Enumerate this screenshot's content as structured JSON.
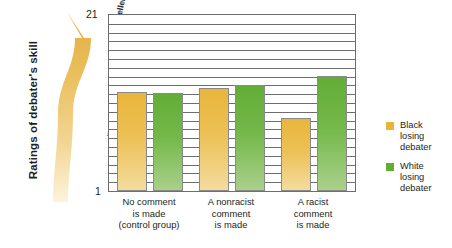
{
  "chart_data": {
    "type": "bar",
    "title": "",
    "ylabel": "Ratings of debater's skill",
    "xlabel": "",
    "ylim": [
      1,
      21
    ],
    "ytick_labels": [
      "1",
      "21"
    ],
    "y_low_anchor": "\"Very poor\"",
    "y_high_anchor": "\"Excellent\"",
    "grid": true,
    "gridline_count": 20,
    "legend_position": "right",
    "categories": [
      "No comment is made (control group)",
      "A nonracist comment is made",
      "A racist comment is made"
    ],
    "category_lines": [
      [
        "No comment",
        "is made",
        "(control group)"
      ],
      [
        "A nonracist",
        "comment",
        "is made"
      ],
      [
        "A racist",
        "comment",
        "is made"
      ]
    ],
    "series": [
      {
        "name": "Black losing debater",
        "color": "#e9b63c",
        "values": [
          12.2,
          12.7,
          9.3
        ]
      },
      {
        "name": "White losing debater",
        "color": "#62ad36",
        "values": [
          12.1,
          13.1,
          14.1
        ]
      }
    ]
  },
  "legend": {
    "items": [
      {
        "swatch": "black",
        "lines": [
          "Black",
          "losing",
          "debater"
        ]
      },
      {
        "swatch": "white",
        "lines": [
          "White",
          "losing",
          "debater"
        ]
      }
    ]
  },
  "axis": {
    "top_tick": "21",
    "bottom_tick": "1",
    "title": "Ratings of debater's skill",
    "arrow_top_label": "\"Excellent\"",
    "arrow_bottom_label": "\"Very poor\""
  }
}
